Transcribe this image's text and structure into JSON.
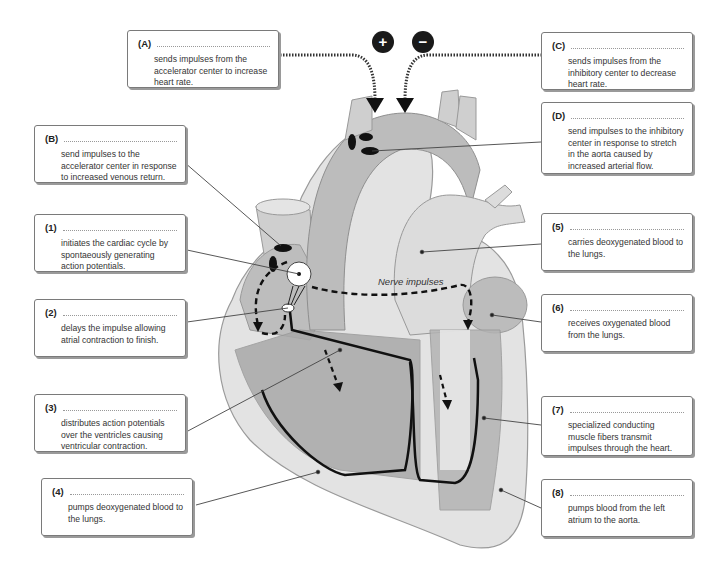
{
  "diagram": {
    "signs": {
      "plus": "+",
      "minus": "−"
    },
    "nerve_label": "Nerve impulses",
    "labels": [
      {
        "key": "(A)",
        "text": "sends impulses from the accelerator center to increase heart rate."
      },
      {
        "key": "(B)",
        "text": "send impulses to the accelerator center in response to increased venous return."
      },
      {
        "key": "(C)",
        "text": "sends impulses from the inhibitory center to decrease heart rate."
      },
      {
        "key": "(D)",
        "text": "send impulses to the inhibitory center in response to stretch in the aorta caused by increased arterial flow."
      },
      {
        "key": "(1)",
        "text": "initiates the cardiac cycle by spontaeously generating action potentials."
      },
      {
        "key": "(2)",
        "text": "delays the impulse allowing atrial contraction to finish."
      },
      {
        "key": "(3)",
        "text": "distributes action potentials over the ventricles causing ventricular contraction."
      },
      {
        "key": "(4)",
        "text": "pumps deoxygenated blood to the lungs."
      },
      {
        "key": "(5)",
        "text": "carries deoxygenated blood to the lungs."
      },
      {
        "key": "(6)",
        "text": "receives oxygenated blood from the lungs."
      },
      {
        "key": "(7)",
        "text": "specialized conducting muscle fibers transmit impulses through the heart."
      },
      {
        "key": "(8)",
        "text": "pumps blood from the left atrium to the aorta."
      }
    ],
    "colors": {
      "heart_light": "#d9d9d9",
      "heart_mid": "#b5b5b5",
      "heart_dark": "#8e8e8e",
      "pathway": "#1a1a1a"
    }
  }
}
